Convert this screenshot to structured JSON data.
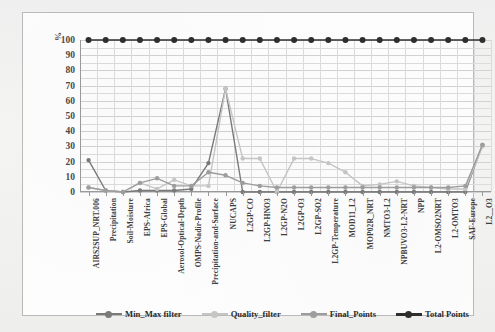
{
  "chart_data": {
    "type": "line",
    "title": "",
    "xlabel": "",
    "ylabel": "%",
    "ylim": [
      0,
      100
    ],
    "ytick_step": 10,
    "yticks": [
      100,
      90,
      80,
      70,
      60,
      50,
      40,
      30,
      20,
      10,
      0
    ],
    "grid": true,
    "legend_position": "bottom",
    "categories": [
      "AIRS2SUP_NRT.006",
      "Precipitation",
      "Soil-Moisture",
      "EPS-Africa",
      "EPS-Global",
      "Aerosol-Optical-Depth",
      "OMPS-Nadir-Profile",
      "Precipitation-and-Surface",
      "NUCAPS",
      "L2GP-CO",
      "L2GP-HNO3",
      "L2GP-N2O",
      "L2GP-O3",
      "L2GP-SO2",
      "L2GP-Temperature",
      "MOD11_L2",
      "MOP02R_NRT",
      "NMTO3-L2",
      "NPBUVO3-L2-NRT",
      "NPP",
      "L2-OMSO2NRT",
      "L2-OMTO3",
      "SAF-Europe",
      "L2__O3"
    ],
    "series": [
      {
        "name": "Min_Max filter",
        "color": "#7a7a7a",
        "values": [
          21,
          1,
          0,
          1,
          1,
          1,
          2,
          19,
          68,
          0,
          0,
          0,
          0,
          0,
          0,
          0,
          0,
          0,
          0,
          0,
          0,
          0,
          0,
          31
        ]
      },
      {
        "name": "Quality_filter",
        "color": "#c6c6c6",
        "values": [
          3,
          1,
          0,
          6,
          2,
          8,
          4,
          4,
          68,
          22,
          22,
          0,
          22,
          22,
          19,
          13,
          4,
          5,
          7,
          4,
          3,
          2,
          2,
          30
        ]
      },
      {
        "name": "Final_Points",
        "color": "#9e9e9e",
        "values": [
          3,
          1,
          0,
          6,
          9,
          4,
          4,
          13,
          11,
          6,
          4,
          3,
          3,
          3,
          3,
          3,
          3,
          3,
          3,
          3,
          3,
          3,
          4,
          31
        ]
      },
      {
        "name": "Total Points",
        "color": "#2e2e2e",
        "values": [
          100,
          100,
          100,
          100,
          100,
          100,
          100,
          100,
          100,
          100,
          100,
          100,
          100,
          100,
          100,
          100,
          100,
          100,
          100,
          100,
          100,
          100,
          100,
          100
        ]
      }
    ]
  },
  "legend": {
    "items": [
      {
        "label": "Min_Max filter"
      },
      {
        "label": "Quality_filter"
      },
      {
        "label": "Final_Points"
      },
      {
        "label": "Total Points"
      }
    ]
  }
}
